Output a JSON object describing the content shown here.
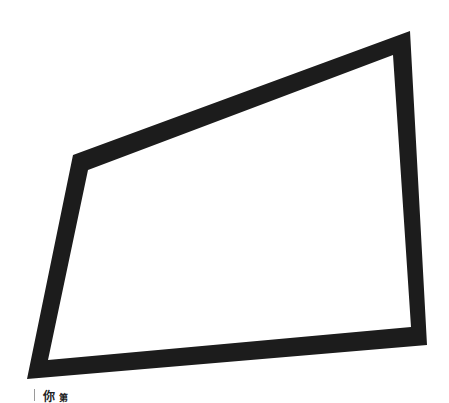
{
  "image": {
    "width": 449,
    "height": 403,
    "background": "#ffffff"
  },
  "frame": {
    "stroke_color": "#1c1c1c",
    "fill_color": "#ffffff",
    "outer": [
      [
        73,
        155
      ],
      [
        410,
        31
      ],
      [
        427,
        345
      ],
      [
        27,
        379
      ]
    ],
    "inner": [
      [
        88,
        170
      ],
      [
        393,
        55
      ],
      [
        411,
        327
      ],
      [
        48,
        360
      ]
    ]
  },
  "caption": {
    "bar_color": "#9a9a9a",
    "char1": "你",
    "char2": "第"
  }
}
